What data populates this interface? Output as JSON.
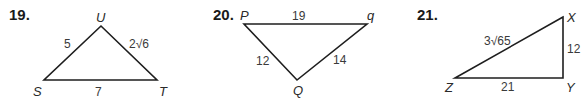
{
  "problems": [
    {
      "number": "19.",
      "vertices": {
        "top": "U",
        "left": "S",
        "right": "T"
      },
      "sides": {
        "SU": "5",
        "UT": "2√6",
        "ST": "7"
      }
    },
    {
      "number": "20.",
      "vertices": {
        "left": "P",
        "right": "q",
        "bottom": "Q"
      },
      "sides": {
        "Pq": "19",
        "PQ": "12",
        "qQ": "14"
      }
    },
    {
      "number": "21.",
      "vertices": {
        "top": "X",
        "left": "Z",
        "right": "Y"
      },
      "sides": {
        "ZX": "3√65",
        "XY": "12",
        "ZY": "21"
      }
    }
  ],
  "colors": {
    "line": "#1e1e1e",
    "text": "#1a1a1a",
    "background": "#ffffff"
  }
}
